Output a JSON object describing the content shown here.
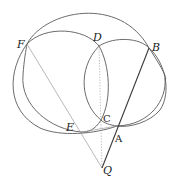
{
  "figure": {
    "type": "geometric-construction",
    "points": {
      "F": {
        "label": "F",
        "x": 27,
        "y": 44,
        "lx": 17,
        "ly": 48
      },
      "D": {
        "label": "D",
        "x": 99,
        "y": 46,
        "lx": 94,
        "ly": 40
      },
      "B": {
        "label": "B",
        "x": 149,
        "y": 48,
        "lx": 152,
        "ly": 50
      },
      "E": {
        "label": "E",
        "x": 82,
        "y": 132,
        "lx": 66,
        "ly": 131
      },
      "C": {
        "label": "C",
        "x": 101,
        "y": 120,
        "lx": 103,
        "ly": 121
      },
      "A": {
        "label": "A",
        "x": 117,
        "y": 126,
        "lx": 116,
        "ly": 141
      },
      "Q": {
        "label": "Q",
        "x": 102,
        "y": 168,
        "lx": 103,
        "ly": 173
      }
    },
    "labels": {
      "F": "F",
      "D": "D",
      "B": "B",
      "E": "E",
      "C": "C",
      "A": "A",
      "Q": "Q"
    }
  }
}
